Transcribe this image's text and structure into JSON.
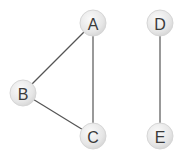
{
  "graph": {
    "nodes": [
      {
        "id": "A",
        "label": "A"
      },
      {
        "id": "B",
        "label": "B"
      },
      {
        "id": "C",
        "label": "C"
      },
      {
        "id": "D",
        "label": "D"
      },
      {
        "id": "E",
        "label": "E"
      }
    ],
    "edges": [
      {
        "from": "A",
        "to": "B"
      },
      {
        "from": "A",
        "to": "C"
      },
      {
        "from": "B",
        "to": "C"
      },
      {
        "from": "D",
        "to": "E"
      }
    ],
    "colors": {
      "node_fill": "#ececec",
      "edge": "#555555",
      "label": "#3a3a3a"
    }
  }
}
